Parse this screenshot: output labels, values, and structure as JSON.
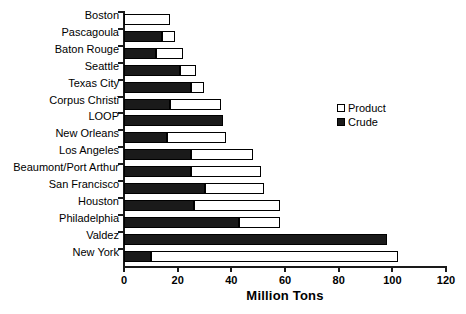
{
  "chart_data": {
    "type": "bar",
    "orientation": "horizontal",
    "stacked": true,
    "title": "",
    "xlabel": "Million Tons",
    "ylabel": "",
    "xlim": [
      0,
      120
    ],
    "xticks": [
      0,
      20,
      40,
      60,
      80,
      100,
      120
    ],
    "xticklabels": [
      "0",
      "20",
      "40",
      "60",
      "80",
      "100",
      "120"
    ],
    "grid": false,
    "legend_position": "upper right inside",
    "categories": [
      "Boston",
      "Pascagoula",
      "Baton Rouge",
      "Seattle",
      "Texas City",
      "Corpus Christi",
      "LOOP",
      "New Orleans",
      "Los Angeles",
      "Beaumont/Port Arthur",
      "San Francisco",
      "Houston",
      "Philadelphia",
      "Valdez",
      "New York"
    ],
    "series": [
      {
        "name": "Crude",
        "color": "#1a1a1a",
        "values": [
          0,
          14,
          12,
          21,
          25,
          17,
          37,
          16,
          25,
          25,
          30,
          26,
          43,
          98,
          10
        ]
      },
      {
        "name": "Product",
        "color": "#ffffff",
        "values": [
          17,
          5,
          10,
          6,
          5,
          19,
          0,
          22,
          23,
          26,
          22,
          32,
          15,
          0,
          92
        ]
      }
    ],
    "totals": [
      17,
      19,
      22,
      27,
      30,
      36,
      37,
      38,
      48,
      51,
      52,
      58,
      58,
      98,
      102
    ]
  },
  "legend": {
    "entries": [
      {
        "label": "Product",
        "swatch": "open-square"
      },
      {
        "label": "Crude",
        "swatch": "filled-square"
      }
    ]
  }
}
